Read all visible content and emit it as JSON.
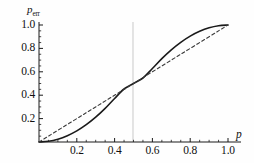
{
  "chart_data": {
    "type": "line",
    "title": "",
    "xlabel": "p",
    "ylabel": "p_err",
    "ylabel_base": "p",
    "ylabel_sub": "err",
    "xlim": [
      0,
      1.05
    ],
    "ylim": [
      0,
      1.05
    ],
    "grid": false,
    "legend": "none",
    "xticks": [
      0.2,
      0.4,
      0.6,
      0.8,
      1.0
    ],
    "xtick_labels": [
      "0.2",
      "0.4",
      "0.6",
      "0.8",
      "1.0"
    ],
    "yticks": [
      0.2,
      0.4,
      0.6,
      0.8,
      1.0
    ],
    "ytick_labels": [
      "0.2",
      "0.4",
      "0.6",
      "0.8",
      "1.0"
    ],
    "minor_tick_count_between": 3,
    "annotations": [
      {
        "name": "vertical-reference-line",
        "x": 0.5,
        "style": "solid",
        "color": "#c8c8c8"
      }
    ],
    "series": [
      {
        "name": "sigmoid-curve",
        "style": "solid",
        "color": "#1a1a1a",
        "width": 1.6,
        "x": [
          0.0,
          0.05,
          0.1,
          0.15,
          0.2,
          0.25,
          0.3,
          0.35,
          0.4,
          0.45,
          0.5,
          0.55,
          0.6,
          0.65,
          0.7,
          0.75,
          0.8,
          0.85,
          0.9,
          0.95,
          1.0
        ],
        "y": [
          0.0,
          0.006,
          0.024,
          0.054,
          0.095,
          0.148,
          0.212,
          0.287,
          0.372,
          0.453,
          0.5,
          0.547,
          0.628,
          0.713,
          0.788,
          0.852,
          0.905,
          0.946,
          0.976,
          0.994,
          1.0
        ]
      },
      {
        "name": "diagonal-reference",
        "style": "dashed",
        "color": "#3a3a3a",
        "width": 1.1,
        "x": [
          0.0,
          0.25,
          0.5,
          0.75,
          1.0
        ],
        "y": [
          0.0,
          0.25,
          0.5,
          0.75,
          1.0
        ]
      }
    ]
  },
  "axes": {
    "x_axis_name": "x-axis",
    "y_axis_name": "y-axis"
  }
}
